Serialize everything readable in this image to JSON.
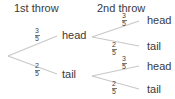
{
  "diagram": {
    "type": "probability-tree",
    "line_color": "#c8c8c8",
    "text_color": "#3a3a3a",
    "headers": {
      "first_throw": "1st throw",
      "second_throw": "2nd throw"
    },
    "first_throw": {
      "head": {
        "label": "head",
        "probability": {
          "numerator": "3",
          "denominator": "5"
        }
      },
      "tail": {
        "label": "tail",
        "probability": {
          "numerator": "2",
          "denominator": "5"
        }
      }
    },
    "second_throw": {
      "after_head": {
        "head": {
          "label": "head",
          "probability": {
            "numerator": "3",
            "denominator": "5"
          }
        },
        "tail": {
          "label": "tail",
          "probability": {
            "numerator": "2",
            "denominator": "5"
          }
        }
      },
      "after_tail": {
        "head": {
          "label": "head",
          "probability": {
            "numerator": "3",
            "denominator": "5"
          }
        },
        "tail": {
          "label": "tail",
          "probability": {
            "numerator": "2",
            "denominator": "5"
          }
        }
      }
    }
  }
}
